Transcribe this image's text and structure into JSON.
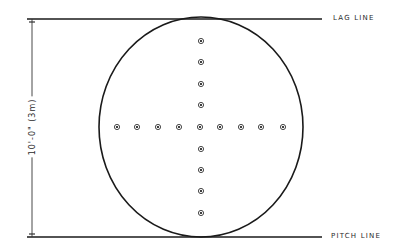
{
  "diagram": {
    "type": "putting-green-layout",
    "top_line_label": "LAG LINE",
    "bottom_line_label": "PITCH LINE",
    "dimension_label": "10'-0\" (3m)",
    "stroke_color": "#1a1a1a",
    "dot_color": "#333333",
    "circle": {
      "cx": 201,
      "cy": 127,
      "rx": 102,
      "ry": 110
    },
    "top_line": {
      "x1": 27,
      "x2": 322,
      "y": 19
    },
    "bottom_line": {
      "x1": 27,
      "x2": 322,
      "y": 237
    },
    "dimension_line": {
      "x": 32,
      "y1": 19,
      "y2": 237
    },
    "horizontal_dots_x": [
      117,
      137,
      158,
      179,
      200,
      220,
      241,
      261,
      283
    ],
    "horizontal_dots_y": 127,
    "vertical_dots_y": [
      41,
      62,
      84,
      105,
      127,
      149,
      170,
      191,
      213
    ],
    "vertical_dots_x": 201
  }
}
